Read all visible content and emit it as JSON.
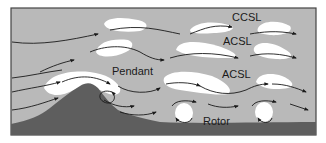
{
  "figure": {
    "colors": {
      "background": "#ffffff",
      "sky": "#b9b9b9",
      "cloud": "#ffffff",
      "terrain": "#5e5e5e",
      "ground": "#5a5a5a",
      "frame": "#444444",
      "arrow": "#1a1a1a"
    }
  },
  "labels": {
    "ccsl": "CCSL",
    "acsl_upper": "ACSL",
    "acsl_lower": "ACSL",
    "pendant": "Pendant",
    "rotor": "Rotor"
  }
}
